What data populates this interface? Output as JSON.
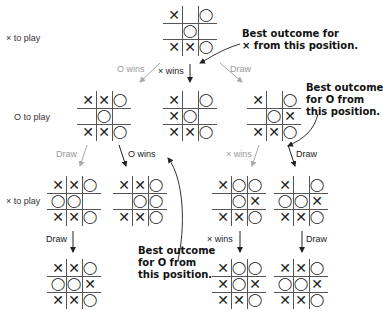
{
  "side_labels": [
    "× to play",
    "O to play",
    "× to play"
  ],
  "boards": {
    "root": [
      "X",
      "",
      "O",
      "",
      "O",
      "",
      "X",
      "X",
      "O"
    ],
    "mid_left": [
      "X",
      "X",
      "O",
      "",
      "O",
      "",
      "X",
      "X",
      "O"
    ],
    "mid_center": [
      "X",
      "",
      "O",
      "X",
      "O",
      "",
      "X",
      "X",
      "O"
    ],
    "mid_right": [
      "X",
      "",
      "O",
      "",
      "O",
      "X",
      "X",
      "X",
      "O"
    ],
    "l3_a": [
      "X",
      "X",
      "O",
      "O",
      "O",
      "",
      "X",
      "X",
      "O"
    ],
    "l3_b": [
      "X",
      "X",
      "O",
      "",
      "O",
      "O",
      "X",
      "X",
      "O"
    ],
    "l3_c": [
      "X",
      "O",
      "O",
      "",
      "O",
      "X",
      "X",
      "X",
      "O"
    ],
    "l3_d": [
      "X",
      "",
      "O",
      "O",
      "O",
      "X",
      "X",
      "X",
      "O"
    ],
    "leaf_a": [
      "X",
      "X",
      "O",
      "O",
      "O",
      "X",
      "X",
      "X",
      "O"
    ],
    "leaf_c": [
      "X",
      "O",
      "O",
      "X",
      "O",
      "X",
      "X",
      "X",
      "O"
    ],
    "leaf_d": [
      "X",
      "X",
      "O",
      "O",
      "O",
      "X",
      "X",
      "X",
      "O"
    ]
  },
  "edge_labels": {
    "root_left": "O wins",
    "root_center": "× wins",
    "root_right": "Draw",
    "midleft_a": "Draw",
    "midleft_b": "O wins",
    "midright_c": "× wins",
    "midright_d": "Draw",
    "l3a_leaf": "Draw",
    "l3c_leaf": "× wins",
    "l3d_leaf": "Draw"
  },
  "notes": {
    "x_best": [
      "Best outcome for",
      "× from this position."
    ],
    "o_best_right": [
      "Best outcome",
      "for O from",
      "this position."
    ],
    "o_best_bottom": [
      "Best outcome",
      "for O from",
      "this position."
    ]
  },
  "colors": {
    "line": "#555555",
    "muted": "#999999",
    "text": "#222222"
  }
}
